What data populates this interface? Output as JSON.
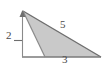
{
  "figure": {
    "type": "geometry-diagram",
    "shape": "obtuse-triangle",
    "background_color": "#ffffff",
    "fill_color": "#c9c9c9",
    "stroke_color": "#6e6e6e",
    "label_color": "#4a4a4a",
    "labels": {
      "height": "2",
      "base": "3",
      "hypotenuse": "5"
    },
    "geometry": {
      "apex": [
        23,
        11
      ],
      "base_left": [
        23,
        57
      ],
      "base_right": [
        101,
        57
      ],
      "interior_foot": [
        45,
        57
      ],
      "height_axis_x": 23,
      "height_tick_y": 40
    },
    "icons": {
      "arrowhead": "arrowhead-icon",
      "height_tick": "tick-mark-icon"
    }
  }
}
